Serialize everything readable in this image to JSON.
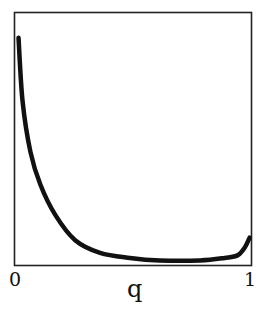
{
  "chart_data": {
    "type": "line",
    "title": "",
    "xlabel": "q",
    "ylabel": "",
    "x_ticks": [
      "0",
      "1"
    ],
    "y_ticks": [],
    "xlim": [
      0,
      1
    ],
    "grid": false,
    "legend": null,
    "series": [
      {
        "name": "curve",
        "color": "#111111",
        "x": [
          0.017,
          0.034,
          0.067,
          0.109,
          0.172,
          0.256,
          0.361,
          0.487,
          0.613,
          0.782,
          0.887,
          0.941,
          0.971,
          0.992
        ],
        "y": [
          0.9,
          0.65,
          0.45,
          0.32,
          0.2,
          0.1,
          0.05,
          0.03,
          0.02,
          0.02,
          0.03,
          0.04,
          0.07,
          0.11
        ]
      }
    ]
  },
  "axes": {
    "x_tick_0": "0",
    "x_tick_1": "1",
    "x_label": "q"
  }
}
